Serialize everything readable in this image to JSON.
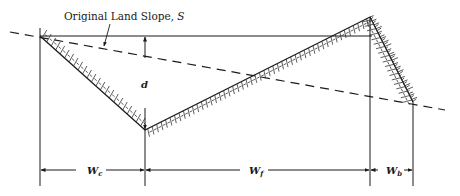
{
  "diagram": {
    "type": "cross-section",
    "labels": {
      "original_slope": "Original Land Slope, ",
      "original_slope_symbol": "S",
      "depth": "d",
      "channel_width_main": "W",
      "channel_width_sub": "c",
      "front_width_main": "W",
      "front_width_sub": "f",
      "back_width_main": "W",
      "back_width_sub": "b"
    },
    "colors": {
      "line": "#1a1a1a",
      "hatch": "#333333",
      "background": "#ffffff"
    },
    "points": {
      "left_top": [
        40,
        36
      ],
      "channel_bottom": [
        145,
        130
      ],
      "ridge_peak": [
        370,
        17
      ],
      "back_toe": [
        413,
        102
      ],
      "top_line_end": [
        372,
        36
      ],
      "slope_start": [
        10,
        32
      ],
      "slope_end": [
        445,
        110
      ]
    },
    "dimension_line_y": 170
  }
}
